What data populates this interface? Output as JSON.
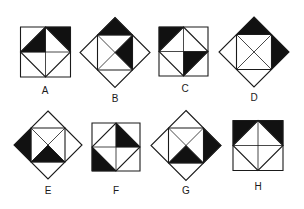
{
  "title": "",
  "figures": [
    {
      "label": "A",
      "shape": "square",
      "cx": 45.5,
      "cy": 52,
      "half": 25,
      "label_x": 45,
      "label_y": 86,
      "shaded": [
        "corner-tr",
        "inner-tl"
      ]
    },
    {
      "label": "B",
      "shape": "diamond",
      "cx": 115,
      "cy": 52.5,
      "half": 35,
      "label_x": 115,
      "label_y": 94,
      "shaded": [
        "corner-top",
        "inner-right"
      ]
    },
    {
      "label": "C",
      "shape": "square",
      "cx": 183.5,
      "cy": 51.5,
      "half": 24.5,
      "label_x": 185,
      "label_y": 84,
      "shaded": [
        "corner-tl",
        "inner-br"
      ]
    },
    {
      "label": "D",
      "shape": "diamond",
      "cx": 254,
      "cy": 52,
      "half": 35,
      "label_x": 254,
      "label_y": 93,
      "shaded": [
        "corner-top",
        "corner-right"
      ]
    },
    {
      "label": "E",
      "shape": "diamond",
      "cx": 48,
      "cy": 145,
      "half": 34,
      "label_x": 48,
      "label_y": 186,
      "shaded": [
        "corner-left",
        "inner-bottom"
      ]
    },
    {
      "label": "F",
      "shape": "square",
      "cx": 116,
      "cy": 147,
      "half": 24,
      "label_x": 116,
      "label_y": 186,
      "shaded": [
        "inner-tr",
        "corner-bl"
      ]
    },
    {
      "label": "G",
      "shape": "diamond",
      "cx": 186,
      "cy": 145.5,
      "half": 35,
      "label_x": 186,
      "label_y": 186,
      "shaded": [
        "corner-right",
        "inner-bottom"
      ]
    },
    {
      "label": "H",
      "shape": "square",
      "cx": 258,
      "cy": 145.5,
      "half": 25,
      "label_x": 258,
      "label_y": 182,
      "shaded": [
        "corner-tl",
        "corner-tr"
      ]
    }
  ],
  "colors": {
    "stroke": "#1a1a1a",
    "fill": "#111111",
    "background": "#ffffff"
  }
}
